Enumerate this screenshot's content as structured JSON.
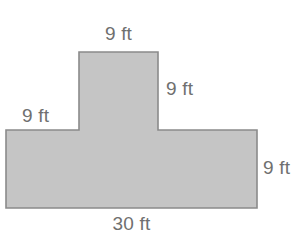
{
  "figure": {
    "kind": "t-shape-polygon",
    "caption_units": "ft",
    "fill_color": "#c5c5c5",
    "stroke_color": "#8a8a8a",
    "label_color": "#6f6f6f",
    "background_color": "#ffffff"
  },
  "labels": {
    "top": "9 ft",
    "stem_right": "9 ft",
    "base_left": "9 ft",
    "base_right": "9 ft",
    "bottom": "30 ft"
  },
  "chart_data": {
    "type": "diagram",
    "title": "",
    "shape": "T-shape (composite rectangle)",
    "units": "ft",
    "dimensions": [
      {
        "name": "stem-top-width",
        "label": "9 ft",
        "value": 9,
        "unit": "ft",
        "edge": "top",
        "position": "above-stem"
      },
      {
        "name": "stem-height",
        "label": "9 ft",
        "value": 9,
        "unit": "ft",
        "edge": "right-of-stem",
        "position": "right"
      },
      {
        "name": "base-left-arm-width",
        "label": "9 ft",
        "value": 9,
        "unit": "ft",
        "edge": "left",
        "position": "above-base-left"
      },
      {
        "name": "base-height",
        "label": "9 ft",
        "value": 9,
        "unit": "ft",
        "edge": "right",
        "position": "right-of-base"
      },
      {
        "name": "base-total-width",
        "label": "30 ft",
        "value": 30,
        "unit": "ft",
        "edge": "bottom",
        "position": "below-base"
      }
    ],
    "vertices_px": [
      [
        79,
        52
      ],
      [
        158,
        52
      ],
      [
        158,
        130
      ],
      [
        257,
        130
      ],
      [
        257,
        208
      ],
      [
        6,
        208
      ],
      [
        6,
        130
      ],
      [
        79,
        130
      ]
    ],
    "rectangles_px": [
      {
        "name": "stem",
        "x": 79,
        "y": 52,
        "width": 79,
        "height": 78
      },
      {
        "name": "base",
        "x": 6,
        "y": 130,
        "width": 251,
        "height": 78
      }
    ],
    "grid": false,
    "legend": "none"
  }
}
